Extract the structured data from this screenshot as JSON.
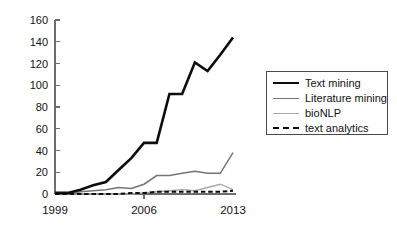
{
  "chart_data": {
    "type": "line",
    "title": "",
    "xlabel": "",
    "ylabel": "",
    "xlim": [
      1999,
      2013
    ],
    "ylim": [
      0,
      160
    ],
    "grid": false,
    "legend_position": "right",
    "x": [
      1999,
      2000,
      2001,
      2002,
      2003,
      2004,
      2005,
      2006,
      2007,
      2008,
      2009,
      2010,
      2011,
      2012,
      2013
    ],
    "yticks": [
      0,
      20,
      40,
      60,
      80,
      100,
      120,
      140,
      160
    ],
    "ytick_labels": [
      "0",
      "20",
      "40",
      "60",
      "80",
      "100",
      "120",
      "140",
      "160"
    ],
    "xticks": [
      1999,
      2006,
      2013
    ],
    "xtick_labels": [
      "1999",
      "2006",
      "2013"
    ],
    "series": [
      {
        "name": "Text mining",
        "color": "#0d0d0d",
        "style": "solid",
        "width": "thick",
        "values": [
          1,
          1,
          4,
          8,
          11,
          22,
          33,
          47,
          47,
          92,
          92,
          121,
          113,
          128,
          144
        ]
      },
      {
        "name": "Literature mining",
        "color": "#757575",
        "style": "solid",
        "width": "medium",
        "values": [
          0,
          0,
          2,
          3,
          4,
          6,
          5,
          9,
          17,
          17,
          19,
          21,
          19,
          19,
          38
        ]
      },
      {
        "name": "bioNLP",
        "color": "#a8a8a8",
        "style": "solid",
        "width": "thin",
        "values": [
          0,
          0,
          0,
          0,
          0,
          0,
          0,
          1,
          2,
          3,
          4,
          3,
          6,
          9,
          4
        ]
      },
      {
        "name": "text analytics",
        "color": "#0d0d0d",
        "style": "dashed",
        "width": "medium",
        "values": [
          0,
          0,
          0,
          0,
          0,
          0,
          1,
          1,
          2,
          2,
          2,
          2,
          2,
          2,
          3
        ]
      }
    ]
  },
  "legend": {
    "items": [
      {
        "label": "Text mining"
      },
      {
        "label": "Literature mining"
      },
      {
        "label": "bioNLP"
      },
      {
        "label": "text analytics"
      }
    ]
  }
}
